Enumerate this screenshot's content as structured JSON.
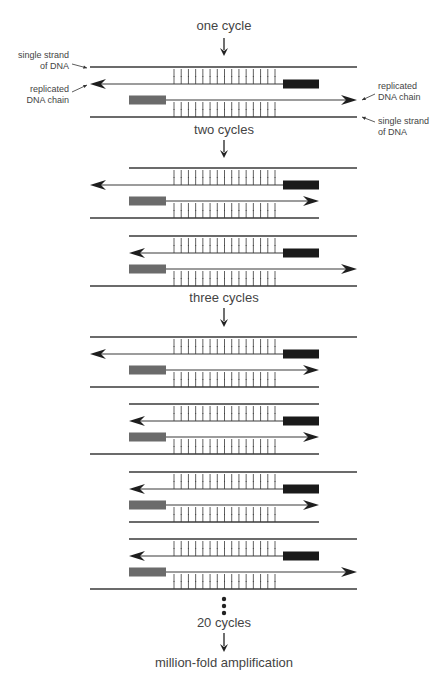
{
  "steps": [
    {
      "label": "one cycle"
    },
    {
      "label": "two cycles"
    },
    {
      "label": "three cycles"
    },
    {
      "label": "20 cycles"
    },
    {
      "label": "million-fold amplification"
    }
  ],
  "annotations": {
    "single_strand_left_line1": "single strand",
    "single_strand_left_line2": "of DNA",
    "replicated_left_line1": "replicated",
    "replicated_left_line2": "DNA chain",
    "replicated_right_line1": "replicated",
    "replicated_right_line2": "DNA chain",
    "single_strand_right_line1": "single strand",
    "single_strand_right_line2": "of DNA"
  },
  "colors": {
    "strand": "#3a3a3a",
    "primer_forward": "#6b6b6b",
    "primer_reverse": "#1a1a1a",
    "text": "#444444"
  },
  "cycles": [
    {
      "name": "one-cycle",
      "molecules": [
        {
          "top": "long",
          "rev": "long",
          "fwd": "long",
          "bottom": "long"
        }
      ]
    },
    {
      "name": "two-cycles",
      "molecules": [
        {
          "top": "short-left",
          "rev": "long",
          "fwd": "short",
          "bottom": "short-right"
        },
        {
          "top": "short-left",
          "rev": "short",
          "fwd": "long",
          "bottom": "long"
        }
      ]
    },
    {
      "name": "three-cycles",
      "molecules": [
        {
          "top": "long",
          "rev": "long",
          "fwd": "short",
          "bottom": "short-right"
        },
        {
          "top": "short",
          "rev": "short",
          "fwd": "short",
          "bottom": "short-right"
        },
        {
          "top": "short-left",
          "rev": "short",
          "fwd": "short",
          "bottom": "short"
        },
        {
          "top": "short-left",
          "rev": "short",
          "fwd": "long",
          "bottom": "long"
        }
      ]
    }
  ],
  "base_pair_ticks": 15
}
